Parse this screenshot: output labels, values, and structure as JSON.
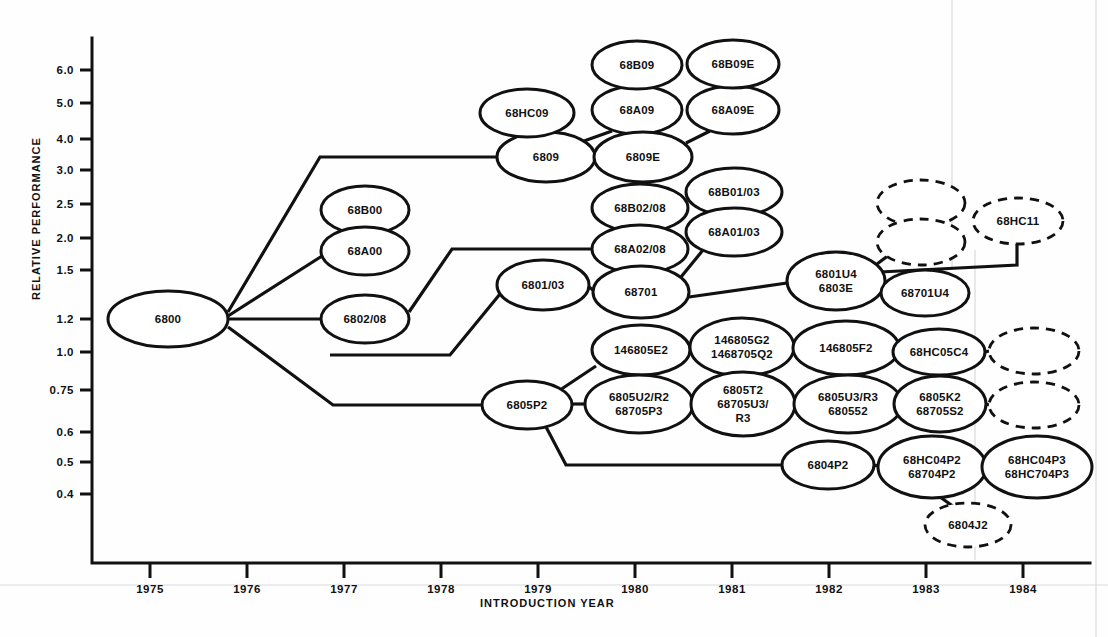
{
  "chart_data": {
    "type": "diagram",
    "title": "",
    "xlabel": "INTRODUCTION YEAR",
    "ylabel": "RELATIVE PERFORMANCE",
    "x_ticks": [
      "1975",
      "1976",
      "1977",
      "1978",
      "1979",
      "1980",
      "1981",
      "1982",
      "1983",
      "1984"
    ],
    "y_ticks": [
      "6.0",
      "5.0",
      "4.0",
      "3.0",
      "2.5",
      "2.0",
      "1.5",
      "1.2",
      "1.0",
      "0.75",
      "0.6",
      "0.5",
      "0.4"
    ],
    "grid": false,
    "legend": "",
    "nodes": [
      {
        "id": "n6800",
        "label": "6800",
        "x": 168,
        "y": 319,
        "rx": 60,
        "ry": 28,
        "style": "solid",
        "year": 1975.2,
        "perf": 1.2
      },
      {
        "id": "n68B00",
        "label": "68B00",
        "x": 365,
        "y": 210,
        "rx": 44,
        "ry": 24,
        "style": "solid",
        "year": 1977.2,
        "perf": 2.5
      },
      {
        "id": "n68A00",
        "label": "68A00",
        "x": 365,
        "y": 251,
        "rx": 44,
        "ry": 24,
        "style": "solid",
        "year": 1977.2,
        "perf": 2.0
      },
      {
        "id": "n6802_08",
        "label": "6802/08",
        "x": 365,
        "y": 319,
        "rx": 44,
        "ry": 24,
        "style": "solid",
        "year": 1977.2,
        "perf": 1.2
      },
      {
        "id": "n6809",
        "label": "6809",
        "x": 546,
        "y": 157,
        "rx": 49,
        "ry": 25,
        "style": "solid",
        "year": 1979.0,
        "perf": 3.5
      },
      {
        "id": "n68HC09",
        "label": "68HC09",
        "x": 527,
        "y": 113,
        "rx": 47,
        "ry": 24,
        "style": "solid",
        "year": 1978.8,
        "perf": 4.5
      },
      {
        "id": "n68A09",
        "label": "68A09",
        "x": 637,
        "y": 110,
        "rx": 45,
        "ry": 24,
        "style": "solid",
        "year": 1980.0,
        "perf": 4.6
      },
      {
        "id": "n68B09",
        "label": "68B09",
        "x": 637,
        "y": 65,
        "rx": 45,
        "ry": 24,
        "style": "solid",
        "year": 1980.0,
        "perf": 6.0
      },
      {
        "id": "n6809E",
        "label": "6809E",
        "x": 643,
        "y": 157,
        "rx": 49,
        "ry": 25,
        "style": "solid",
        "year": 1980.0,
        "perf": 3.5
      },
      {
        "id": "n68A09E",
        "label": "68A09E",
        "x": 733,
        "y": 110,
        "rx": 46,
        "ry": 24,
        "style": "solid",
        "year": 1981.0,
        "perf": 4.6
      },
      {
        "id": "n68B09E",
        "label": "68B09E",
        "x": 733,
        "y": 64,
        "rx": 46,
        "ry": 24,
        "style": "solid",
        "year": 1981.0,
        "perf": 6.0
      },
      {
        "id": "n68B02_08",
        "label": "68B02/08",
        "x": 640,
        "y": 208,
        "rx": 48,
        "ry": 24,
        "style": "solid",
        "year": 1980.0,
        "perf": 2.5
      },
      {
        "id": "n68A02_08",
        "label": "68A02/08",
        "x": 640,
        "y": 249,
        "rx": 48,
        "ry": 24,
        "style": "solid",
        "year": 1980.0,
        "perf": 2.0
      },
      {
        "id": "n68B01_03",
        "label": "68B01/03",
        "x": 734,
        "y": 192,
        "rx": 48,
        "ry": 24,
        "style": "solid",
        "year": 1981.0,
        "perf": 2.7
      },
      {
        "id": "n68A01_03",
        "label": "68A01/03",
        "x": 734,
        "y": 232,
        "rx": 48,
        "ry": 24,
        "style": "solid",
        "year": 1981.0,
        "perf": 2.15
      },
      {
        "id": "n6801_03",
        "label": "6801/03",
        "x": 543,
        "y": 285,
        "rx": 46,
        "ry": 25,
        "style": "solid",
        "year": 1979.0,
        "perf": 1.6
      },
      {
        "id": "n68701",
        "label": "68701",
        "x": 641,
        "y": 292,
        "rx": 48,
        "ry": 26,
        "style": "solid",
        "year": 1980.0,
        "perf": 1.55
      },
      {
        "id": "n6801U4",
        "label": "6801U4|6803E",
        "x": 836,
        "y": 281,
        "rx": 49,
        "ry": 29,
        "style": "solid",
        "year": 1982.0,
        "perf": 1.6
      },
      {
        "id": "n68701U4",
        "label": "68701U4",
        "x": 925,
        "y": 293,
        "rx": 44,
        "ry": 23,
        "style": "solid",
        "year": 1983.0,
        "perf": 1.5
      },
      {
        "id": "nblank1",
        "label": "",
        "x": 921,
        "y": 203,
        "rx": 44,
        "ry": 23,
        "style": "dashed",
        "year": 1983.0,
        "perf": 2.6
      },
      {
        "id": "nblank2",
        "label": "",
        "x": 921,
        "y": 242,
        "rx": 44,
        "ry": 23,
        "style": "dashed",
        "year": 1983.0,
        "perf": 2.1
      },
      {
        "id": "n68HC11",
        "label": "68HC11",
        "x": 1018,
        "y": 221,
        "rx": 45,
        "ry": 23,
        "style": "dashed",
        "year": 1984.0,
        "perf": 2.3
      },
      {
        "id": "n146805E2",
        "label": "146805E2",
        "x": 641,
        "y": 350,
        "rx": 49,
        "ry": 25,
        "style": "solid",
        "year": 1980.0,
        "perf": 1.0
      },
      {
        "id": "n146805G2",
        "label": "146805G2|1468705Q2",
        "x": 742,
        "y": 347,
        "rx": 52,
        "ry": 29,
        "style": "solid",
        "year": 1981.0,
        "perf": 1.05
      },
      {
        "id": "n146805F2",
        "label": "146805F2",
        "x": 846,
        "y": 348,
        "rx": 53,
        "ry": 27,
        "style": "solid",
        "year": 1982.0,
        "perf": 1.0
      },
      {
        "id": "n68HC05C4",
        "label": "68HC05C4",
        "x": 939,
        "y": 352,
        "rx": 46,
        "ry": 23,
        "style": "solid",
        "year": 1983.0,
        "perf": 0.95
      },
      {
        "id": "nblank3",
        "label": "",
        "x": 1034,
        "y": 351,
        "rx": 45,
        "ry": 23,
        "style": "dashed",
        "year": 1984.0,
        "perf": 0.95
      },
      {
        "id": "n6805P2",
        "label": "6805P2",
        "x": 527,
        "y": 405,
        "rx": 45,
        "ry": 24,
        "style": "solid",
        "year": 1979.0,
        "perf": 0.75
      },
      {
        "id": "n6805U2R2",
        "label": "6805U2/R2|68705P3",
        "x": 639,
        "y": 404,
        "rx": 54,
        "ry": 29,
        "style": "solid",
        "year": 1980.0,
        "perf": 0.75
      },
      {
        "id": "n6805T2",
        "label": "6805T2|68705U3/|R3",
        "x": 743,
        "y": 404,
        "rx": 52,
        "ry": 32,
        "style": "solid",
        "year": 1981.0,
        "perf": 0.75
      },
      {
        "id": "n6805U3R3",
        "label": "6805U3/R3|680552",
        "x": 848,
        "y": 404,
        "rx": 54,
        "ry": 29,
        "style": "solid",
        "year": 1982.0,
        "perf": 0.75
      },
      {
        "id": "n6805K2",
        "label": "6805K2|68705S2",
        "x": 940,
        "y": 404,
        "rx": 46,
        "ry": 28,
        "style": "solid",
        "year": 1983.0,
        "perf": 0.75
      },
      {
        "id": "nblank4",
        "label": "",
        "x": 1034,
        "y": 405,
        "rx": 45,
        "ry": 23,
        "style": "dashed",
        "year": 1984.0,
        "perf": 0.75
      },
      {
        "id": "n6804P2",
        "label": "6804P2",
        "x": 828,
        "y": 465,
        "rx": 46,
        "ry": 24,
        "style": "solid",
        "year": 1982.0,
        "perf": 0.5
      },
      {
        "id": "n68HC04P2",
        "label": "68HC04P2|68704P2",
        "x": 932,
        "y": 467,
        "rx": 54,
        "ry": 31,
        "style": "solid",
        "year": 1983.0,
        "perf": 0.5
      },
      {
        "id": "n68HC04P3",
        "label": "68HC04P3|68HC704P3",
        "x": 1037,
        "y": 467,
        "rx": 55,
        "ry": 31,
        "style": "solid",
        "year": 1984.0,
        "perf": 0.5
      },
      {
        "id": "n6804J2",
        "label": "6804J2",
        "x": 968,
        "y": 525,
        "rx": 43,
        "ry": 22,
        "style": "dashed",
        "year": 1983.4,
        "perf": 0.42
      }
    ],
    "edges": [
      {
        "from": "6800",
        "to": "6809",
        "path": "M 228 312 L 320 157 L 497 157"
      },
      {
        "from": "6800",
        "to": "68A00",
        "path": "M 228 316 L 322 256"
      },
      {
        "from": "68A00",
        "to": "68B00",
        "path": "M 365 227 L 365 234"
      },
      {
        "from": "6800",
        "to": "6802/08",
        "path": "M 228 319 L 321 319"
      },
      {
        "from": "6800",
        "to": "6805P2",
        "path": "M 228 327 L 333 405 L 482 405"
      },
      {
        "from": "6802/08",
        "to": "68A02/08",
        "path": "M 409 312 L 452 249 L 592 249"
      },
      {
        "from": "6809",
        "to": "68HC09",
        "path": "M 543 132 L 543 137"
      },
      {
        "from": "6809",
        "to": "68A09",
        "path": "M 584 141 L 612 131"
      },
      {
        "from": "68A09",
        "to": "68B09",
        "path": "M 637 86 L 637 89"
      },
      {
        "from": "6809",
        "to": "6809E",
        "path": "M 595 157 L 594 157"
      },
      {
        "from": "6809E",
        "to": "68A09E",
        "path": "M 686 143 L 710 131"
      },
      {
        "from": "68A09E",
        "to": "68B09E",
        "path": "M 733 86 L 733 88"
      },
      {
        "from": "68A02/08",
        "to": "68B02/08",
        "path": "M 640 225 L 640 232"
      },
      {
        "from": "68A02/08",
        "to": "68701",
        "path": "M 640 273 L 640 266"
      },
      {
        "from": "68701",
        "to": "68A01/03",
        "path": "M 681 277 L 703 250"
      },
      {
        "from": "68A01/03",
        "to": "68B01/03",
        "path": "M 734 208 L 734 216"
      },
      {
        "from": "6801/03",
        "to": "68701",
        "path": "M 589 287 L 593 290"
      },
      {
        "from": "6801/03",
        "to": "6805P2",
        "path": "M 500 294 L 450 355 L 330 355"
      },
      {
        "from": "68701",
        "to": "6801U4",
        "path": "M 689 297 L 787 283"
      },
      {
        "from": "6801U4",
        "to": "68701U4",
        "path": "M 885 285 L 881 290"
      },
      {
        "from": "6801U4",
        "to": "blank2",
        "path": "M 877 264 L 893 252"
      },
      {
        "from": "blank1",
        "to": "blank2",
        "path": "M 921 226 L 921 219"
      },
      {
        "from": "6801U4",
        "to": "68HC11",
        "path": "M 880 272 L 1017 265 L 1017 244"
      },
      {
        "from": "6805P2",
        "to": "146805E2",
        "path": "M 560 390 L 596 366"
      },
      {
        "from": "146805E2",
        "to": "146805G2",
        "path": "M 690 349 L 690 347"
      },
      {
        "from": "146805G2",
        "to": "146805F2",
        "path": "M 794 348 L 793 348"
      },
      {
        "from": "146805F2",
        "to": "68HC05C4",
        "path": "M 899 350 L 893 351"
      },
      {
        "from": "68HC05C4",
        "to": "blank3",
        "path": "M 985 352 L 989 351"
      },
      {
        "from": "6805P2",
        "to": "6805U2R2",
        "path": "M 572 404 L 585 404"
      },
      {
        "from": "6805U2R2",
        "to": "6805T2",
        "path": "M 693 404 L 691 404"
      },
      {
        "from": "6805T2",
        "to": "6805U3R3",
        "path": "M 795 404 L 794 404"
      },
      {
        "from": "6805U3R3",
        "to": "6805K2",
        "path": "M 902 404 L 894 404"
      },
      {
        "from": "6805K2",
        "to": "blank4",
        "path": "M 986 404 L 989 405"
      },
      {
        "from": "6805P2",
        "to": "6804P2",
        "path": "M 545 425 L 566 465 L 782 465"
      },
      {
        "from": "6804P2",
        "to": "68HC04P2",
        "path": "M 874 465 L 878 466"
      },
      {
        "from": "68HC04P2",
        "to": "68HC04P3",
        "path": "M 986 467 L 982 467"
      },
      {
        "from": "68HC04P2",
        "to": "6804J2",
        "path": "M 940 497 L 957 509"
      }
    ]
  },
  "axes": {
    "y_label": "RELATIVE PERFORMANCE",
    "x_label": "INTRODUCTION YEAR",
    "y_ticks": [
      {
        "label": "6.0",
        "y": 70
      },
      {
        "label": "5.0",
        "y": 103
      },
      {
        "label": "4.0",
        "y": 139
      },
      {
        "label": "3.0",
        "y": 170
      },
      {
        "label": "2.5",
        "y": 204
      },
      {
        "label": "2.0",
        "y": 238
      },
      {
        "label": "1.5",
        "y": 270
      },
      {
        "label": "1.2",
        "y": 319
      },
      {
        "label": "1.0",
        "y": 352
      },
      {
        "label": "0.75",
        "y": 390
      },
      {
        "label": "0.6",
        "y": 432
      },
      {
        "label": "0.5",
        "y": 462
      },
      {
        "label": "0.4",
        "y": 494
      }
    ],
    "x_ticks": [
      {
        "label": "1975",
        "x": 150
      },
      {
        "label": "1976",
        "x": 247
      },
      {
        "label": "1977",
        "x": 344
      },
      {
        "label": "1978",
        "x": 441
      },
      {
        "label": "1979",
        "x": 538
      },
      {
        "label": "1980",
        "x": 635
      },
      {
        "label": "1981",
        "x": 732
      },
      {
        "label": "1982",
        "x": 829
      },
      {
        "label": "1983",
        "x": 926
      },
      {
        "label": "1984",
        "x": 1023
      }
    ]
  },
  "colors": {
    "ink": "#111111",
    "paper": "#fefefe",
    "page_edge": "#d9d9d9"
  }
}
